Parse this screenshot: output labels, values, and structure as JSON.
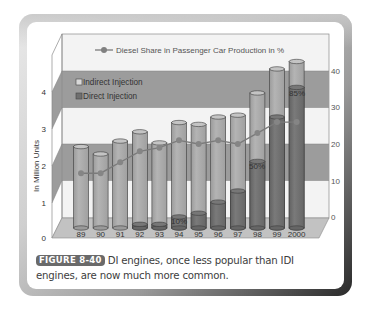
{
  "figure": {
    "label": "FIGURE 8-40",
    "caption": "DI engines, once less popular than IDI engines, are now much more common."
  },
  "legend": {
    "line_label": "Diesel Share in Passenger Car Production in %",
    "indirect_label": "Indirect Injection",
    "direct_label": "Direct Injection"
  },
  "axes": {
    "ylabel_left": "In Million Units",
    "left_ticks": [
      "0",
      "1",
      "2",
      "3",
      "4"
    ],
    "right_ticks": [
      "0",
      "10",
      "20",
      "30",
      "40"
    ]
  },
  "annotations": {
    "pct_94": "10%",
    "pct_98": "50%",
    "pct_2000": "85%"
  },
  "colors": {
    "indirect": "#a9a9a9",
    "direct": "#6f6f6f",
    "band": "#9a9a9a",
    "line": "#7a7a7a",
    "wall": "#f2f2f2",
    "caption_label_bg": "#6a6a6a"
  },
  "chart_data": {
    "type": "bar",
    "title": "Diesel Share in Passenger Car Production in %",
    "categories": [
      "89",
      "90",
      "91",
      "92",
      "93",
      "94",
      "95",
      "96",
      "97",
      "98",
      "99",
      "2000"
    ],
    "series": [
      {
        "name": "Indirect Injection",
        "axis": "left",
        "stacked": true,
        "values": [
          2.2,
          2.0,
          2.35,
          2.5,
          2.2,
          2.55,
          2.4,
          2.3,
          2.05,
          1.85,
          1.3,
          0.7
        ]
      },
      {
        "name": "Direct Injection",
        "axis": "left",
        "stacked": true,
        "values": [
          0.0,
          0.0,
          0.0,
          0.1,
          0.1,
          0.3,
          0.4,
          0.7,
          1.0,
          1.8,
          3.0,
          3.8
        ]
      },
      {
        "name": "Diesel Share in Passenger Car Production in %",
        "type": "line",
        "axis": "right",
        "values": [
          12,
          12,
          15,
          18,
          19,
          21,
          20,
          21,
          20,
          23,
          26,
          26
        ]
      }
    ],
    "totals": [
      2.2,
      2.0,
      2.35,
      2.6,
      2.3,
      2.85,
      2.8,
      3.0,
      3.05,
      3.65,
      4.3,
      4.5
    ],
    "annotations": [
      {
        "category": "94",
        "text": "10%"
      },
      {
        "category": "98",
        "text": "50%"
      },
      {
        "category": "2000",
        "text": "85%"
      }
    ],
    "xlabel": "",
    "ylabel": "In Million Units",
    "ylabel_right": "%",
    "ylim": [
      0,
      4.5
    ],
    "ylim_right": [
      0,
      40
    ],
    "legend_position": "upper-left inside",
    "grid": true,
    "style": "3d cylinders"
  }
}
